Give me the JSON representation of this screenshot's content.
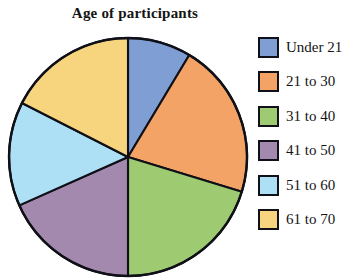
{
  "chart_data": {
    "type": "pie",
    "title": "Age of participants",
    "xlabel": "",
    "ylabel": "",
    "legend_position": "right",
    "grid": false,
    "categories": [
      "Under 21",
      "21 to 30",
      "31 to 40",
      "41 to 50",
      "51 to 60",
      "61 to 70"
    ],
    "values": [
      8.6,
      21.1,
      20.3,
      18.3,
      14.2,
      17.5
    ],
    "units": "percent",
    "start_angle_deg": 0,
    "direction": "clockwise",
    "slices": [
      {
        "label": "Under 21",
        "value": 8.6,
        "angle_deg": 31,
        "start_deg": 0,
        "end_deg": 31,
        "color": "#7f9fd4",
        "edge_color": "#101018"
      },
      {
        "label": "21 to 30",
        "value": 21.1,
        "angle_deg": 76,
        "start_deg": 31,
        "end_deg": 107,
        "color": "#f2a365",
        "edge_color": "#101018"
      },
      {
        "label": "31 to 40",
        "value": 20.3,
        "angle_deg": 73,
        "start_deg": 107,
        "end_deg": 180,
        "color": "#9ecb72",
        "edge_color": "#101018"
      },
      {
        "label": "41 to 50",
        "value": 18.3,
        "angle_deg": 66,
        "start_deg": 180,
        "end_deg": 246,
        "color": "#a389ad",
        "edge_color": "#101018"
      },
      {
        "label": "51 to 60",
        "value": 14.2,
        "angle_deg": 51,
        "start_deg": 246,
        "end_deg": 297,
        "color": "#ade0f4",
        "edge_color": "#101018"
      },
      {
        "label": "61 to 70",
        "value": 17.5,
        "angle_deg": 63,
        "start_deg": 297,
        "end_deg": 360,
        "color": "#f7d47e",
        "edge_color": "#101018"
      }
    ]
  },
  "legend": {
    "items": [
      {
        "label": "Under 21",
        "color": "#7f9fd4"
      },
      {
        "label": "21 to 30",
        "color": "#f2a365"
      },
      {
        "label": "31 to 40",
        "color": "#9ecb72"
      },
      {
        "label": "41 to 50",
        "color": "#a389ad"
      },
      {
        "label": "51 to 60",
        "color": "#ade0f4"
      },
      {
        "label": "61 to 70",
        "color": "#f7d47e"
      }
    ]
  },
  "geometry": {
    "center_x": 128,
    "center_y": 157,
    "radius": 119
  }
}
